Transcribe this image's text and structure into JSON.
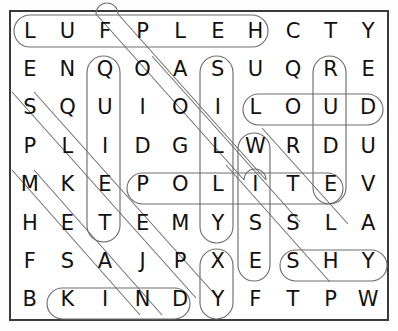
{
  "puzzle": {
    "kind": "word-search",
    "rows": 8,
    "cols": 10,
    "frame_color": "#3a3a3a",
    "letter_color": "#111111",
    "loop_color": "#6f6f6f",
    "grid": [
      [
        "L",
        "U",
        "F",
        "P",
        "L",
        "E",
        "H",
        "C",
        "T",
        "Y"
      ],
      [
        "E",
        "N",
        "Q",
        "O",
        "A",
        "S",
        "U",
        "Q",
        "R",
        "E"
      ],
      [
        "S",
        "Q",
        "U",
        "I",
        "O",
        "I",
        "L",
        "O",
        "U",
        "D"
      ],
      [
        "P",
        "L",
        "I",
        "D",
        "G",
        "L",
        "W",
        "R",
        "D",
        "U"
      ],
      [
        "M",
        "K",
        "E",
        "P",
        "O",
        "L",
        "I",
        "T",
        "E",
        "V"
      ],
      [
        "H",
        "E",
        "T",
        "E",
        "M",
        "Y",
        "S",
        "S",
        "L",
        "A"
      ],
      [
        "F",
        "S",
        "A",
        "J",
        "P",
        "X",
        "E",
        "S",
        "H",
        "Y"
      ],
      [
        "B",
        "K",
        "I",
        "N",
        "D",
        "Y",
        "F",
        "T",
        "P",
        "W"
      ]
    ],
    "rows_text": [
      "L U F P L E H C T Y",
      "E N Q O A S U Q R E",
      "S Q U I O I L O U D",
      "P L I D G L W R D U",
      "M K E P O L I T E V",
      "H E T E M Y S S L A",
      "F S A J P X E S H Y",
      "B K I N D Y F T P W"
    ],
    "found_words": [
      {
        "word": "HELPFUL",
        "shown_as": "LUFPLEH",
        "direction": "horizontal-reversed",
        "row": 1,
        "from_col": 1,
        "to_col": 7
      },
      {
        "word": "LOUD",
        "shown_as": "LOUD",
        "direction": "horizontal",
        "row": 3,
        "from_col": 7,
        "to_col": 10
      },
      {
        "word": "POLITE",
        "shown_as": "POLITE",
        "direction": "horizontal",
        "row": 5,
        "from_col": 4,
        "to_col": 9
      },
      {
        "word": "SHY",
        "shown_as": "SHY",
        "direction": "horizontal",
        "row": 7,
        "from_col": 7,
        "to_col": 9
      },
      {
        "word": "KIND",
        "shown_as": "KIND",
        "direction": "horizontal",
        "row": 8,
        "from_col": 2,
        "to_col": 5
      },
      {
        "word": "QUIET",
        "shown_as": "QUIET",
        "direction": "vertical",
        "col": 3,
        "from_row": 2,
        "to_row": 6
      },
      {
        "word": "SILLY",
        "shown_as": "SILLY",
        "direction": "vertical",
        "col": 6,
        "from_row": 2,
        "to_row": 6
      },
      {
        "word": "RUDE",
        "shown_as": "RUDE",
        "direction": "vertical",
        "col": 9,
        "from_row": 2,
        "to_row": 5
      },
      {
        "word": "WISE",
        "shown_as": "WISE",
        "direction": "vertical",
        "col": 7,
        "from_row": 4,
        "to_row": 7
      },
      {
        "word": "YESNY",
        "shown_as": "Y",
        "direction": "vertical",
        "col": 6,
        "from_row": 7,
        "to_row": 8
      }
    ],
    "diagonal_marks": 9
  }
}
